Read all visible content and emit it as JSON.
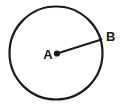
{
  "figure": {
    "kind": "circle-with-radius",
    "background_color": "#ffffff",
    "stroke_color": "#1a1a1a"
  },
  "circle": {
    "name": "circle-outline",
    "center_x": 56,
    "center_y": 53,
    "radius": 46.5,
    "stroke_width": 2.2,
    "fill": "none"
  },
  "center_point": {
    "name": "center-point-a",
    "x": 57,
    "y": 53.5,
    "dot_radius": 3.1
  },
  "radius_segment": {
    "name": "radius-segment-ab",
    "x1": 57,
    "y1": 53.5,
    "x2": 101.5,
    "y2": 39.5,
    "stroke_width": 2.0
  },
  "labels": {
    "center": {
      "text": "A",
      "x": 48,
      "y": 59,
      "font_size": 13
    },
    "edge": {
      "text": "B",
      "x": 106,
      "y": 41,
      "font_size": 13
    }
  }
}
